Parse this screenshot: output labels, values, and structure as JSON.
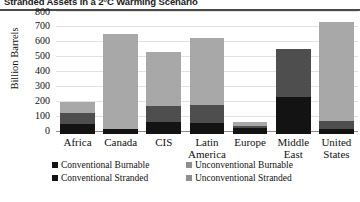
{
  "header": {
    "figure_number": "4.",
    "title": "Stranded Assets in a 2°C Warming Scenario"
  },
  "chart_data": {
    "type": "bar",
    "stacked": true,
    "title": "Stranded Assets in a 2°C Warming Scenario",
    "xlabel": "",
    "ylabel": "Billion Barrels",
    "ylim": [
      0,
      800
    ],
    "yticks": [
      "800",
      "700",
      "600",
      "500",
      "400",
      "300",
      "200",
      "100",
      "0"
    ],
    "ytick_values": [
      800,
      700,
      600,
      500,
      400,
      300,
      200,
      100,
      0
    ],
    "grid": true,
    "legend_position": "bottom",
    "categories": [
      "Africa",
      "Canada",
      "CIS",
      "Latin\nAmerica",
      "Europe",
      "Middle\nEast",
      "United\nStates"
    ],
    "category_lines": [
      [
        "Africa"
      ],
      [
        "Canada"
      ],
      [
        "CIS"
      ],
      [
        "Latin",
        "America"
      ],
      [
        "Europe"
      ],
      [
        "Middle",
        "East"
      ],
      [
        "United",
        "States"
      ]
    ],
    "series": [
      {
        "name": "Conventional Burnable",
        "key": "cb",
        "color": "#131313",
        "values": [
          70,
          35,
          80,
          75,
          40,
          250,
          35
        ]
      },
      {
        "name": "Conventional Stranded",
        "key": "cs",
        "color": "#4e4e4e",
        "values": [
          70,
          0,
          105,
          120,
          15,
          315,
          55
        ]
      },
      {
        "name": "Unconventional Burnable",
        "key": "ub",
        "color": "#a8a8a8",
        "values": [
          0,
          0,
          0,
          0,
          0,
          0,
          0
        ]
      },
      {
        "name": "Unconventional Stranded",
        "key": "us",
        "color": "#a8a8a8",
        "values": [
          75,
          635,
          360,
          445,
          27,
          0,
          660
        ]
      }
    ],
    "totals": [
      215,
      670,
      545,
      640,
      82,
      565,
      750
    ]
  },
  "legend": {
    "items": [
      {
        "label": "Conventional Burnable",
        "key": "cb",
        "color": "#131313"
      },
      {
        "label": "Unconventional Burnable",
        "key": "ub",
        "color": "#8f8f8f"
      },
      {
        "label": "Conventional Stranded",
        "key": "cs",
        "color": "#131313"
      },
      {
        "label": "Unconventional Stranded",
        "key": "us",
        "color": "#8f8f8f"
      }
    ]
  }
}
